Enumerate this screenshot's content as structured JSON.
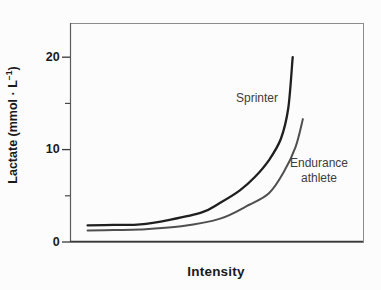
{
  "figure": {
    "ylabel_prefix": "Lactate (mmol · L",
    "ylabel_sup": "−1",
    "ylabel_suffix": ")"
  },
  "chart_data": {
    "type": "line",
    "title": "",
    "xlabel": "Intensity",
    "ylabel": "Lactate (mmol · L⁻¹)",
    "xlim": [
      0,
      100
    ],
    "ylim": [
      0,
      23.7
    ],
    "xticks": [],
    "yticks_major": [
      0,
      10,
      20
    ],
    "yticks_minor": [
      5,
      15
    ],
    "ytick_labels": [
      "0",
      "10",
      "20"
    ],
    "grid": false,
    "legend": "none (inline curve annotations)",
    "colors": {
      "sprinter_curve": "#1f1f1f",
      "endurance_curve": "#4f4f4f",
      "frame": "#8c8c8c",
      "axis": "#3a3a3a",
      "text": "#1a1a1a",
      "annotation_text": "#3d3d3d"
    },
    "series": [
      {
        "name": "Sprinter",
        "color": "#1f1f1f",
        "stroke_width": 2.3,
        "points": [
          [
            6,
            1.8
          ],
          [
            15,
            1.85
          ],
          [
            24,
            1.9
          ],
          [
            34,
            2.4
          ],
          [
            45,
            3.2
          ],
          [
            51,
            4.2
          ],
          [
            58,
            5.6
          ],
          [
            63,
            7.0
          ],
          [
            68,
            8.9
          ],
          [
            72,
            11.2
          ],
          [
            74.5,
            14.5
          ],
          [
            76,
            20.0
          ]
        ]
      },
      {
        "name": "Endurance athlete",
        "color": "#4f4f4f",
        "stroke_width": 2.0,
        "points": [
          [
            6,
            1.25
          ],
          [
            15,
            1.3
          ],
          [
            24,
            1.35
          ],
          [
            38,
            1.7
          ],
          [
            51,
            2.5
          ],
          [
            61,
            4.0
          ],
          [
            68,
            5.3
          ],
          [
            73,
            7.6
          ],
          [
            77,
            10.3
          ],
          [
            79.5,
            13.3
          ]
        ]
      }
    ],
    "annotations": [
      {
        "text": "Sprinter",
        "x": 64,
        "y": 15.5
      },
      {
        "text": "Endurance\nathlete",
        "x": 85,
        "y": 7.7
      }
    ]
  }
}
